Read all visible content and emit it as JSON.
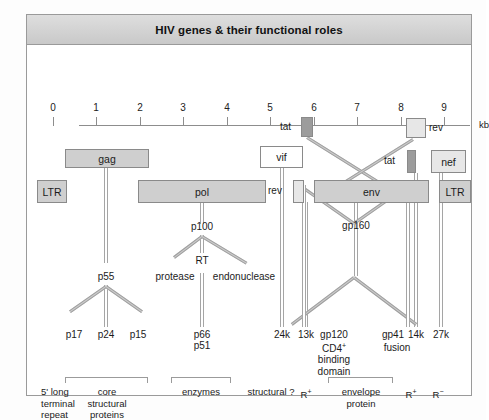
{
  "figure": {
    "title": "HIV genes & their functional roles",
    "axis": {
      "unit": "kb",
      "ticks": [
        {
          "label": "0",
          "kb": 0
        },
        {
          "label": "1",
          "kb": 1
        },
        {
          "label": "2",
          "kb": 2
        },
        {
          "label": "3",
          "kb": 3
        },
        {
          "label": "4",
          "kb": 4
        },
        {
          "label": "5",
          "kb": 5
        },
        {
          "label": "6",
          "kb": 6
        },
        {
          "label": "7",
          "kb": 7
        },
        {
          "label": "8",
          "kb": 8
        },
        {
          "label": "9",
          "kb": 9
        }
      ]
    },
    "genes": [
      {
        "name": "ltr_left",
        "label": "LTR"
      },
      {
        "name": "gag",
        "label": "gag"
      },
      {
        "name": "pol",
        "label": "pol"
      },
      {
        "name": "vif",
        "label": "vif"
      },
      {
        "name": "tat1",
        "label": "tat"
      },
      {
        "name": "rev1",
        "label": "rev"
      },
      {
        "name": "env",
        "label": "env"
      },
      {
        "name": "rev2",
        "label": "rev"
      },
      {
        "name": "tat2",
        "label": "tat"
      },
      {
        "name": "nef",
        "label": "nef"
      },
      {
        "name": "ltr_right",
        "label": "LTR"
      }
    ],
    "products": {
      "gag_precursor": "p55",
      "gag_cleaved": [
        "p17",
        "p24",
        "p15"
      ],
      "pol_precursor": "p100",
      "pol_rt": "RT",
      "pol_protease": "protease",
      "pol_endonuclease": "endonuclease",
      "pol_rt_sizes_1": "p66",
      "pol_rt_sizes_2": "p51",
      "vif_product": "24k",
      "rev1_product": "13k",
      "env_precursor": "gp160",
      "env_surface": "gp120",
      "env_transmembrane": "gp41",
      "tat2_product": "14k",
      "nef_product": "27k",
      "gp120_role_1": "CD4",
      "gp120_role_1_sup": "+",
      "gp120_role_2": "binding",
      "gp120_role_3": "domain",
      "gp41_role": "fusion"
    },
    "footnotes": {
      "ltr_left": [
        "5' long",
        "terminal",
        "repeat"
      ],
      "core": [
        "core",
        "structural",
        "proteins"
      ],
      "enzymes": [
        "enzymes"
      ],
      "structural_q": "structural ?",
      "reg_pos_1_base": "R",
      "reg_pos_1_sup": "+",
      "envelope": [
        "envelope",
        "protein"
      ],
      "reg_pos_2_base": "R",
      "reg_pos_2_sup": "+",
      "reg_neg_base": "R",
      "reg_neg_sup": "−"
    }
  }
}
